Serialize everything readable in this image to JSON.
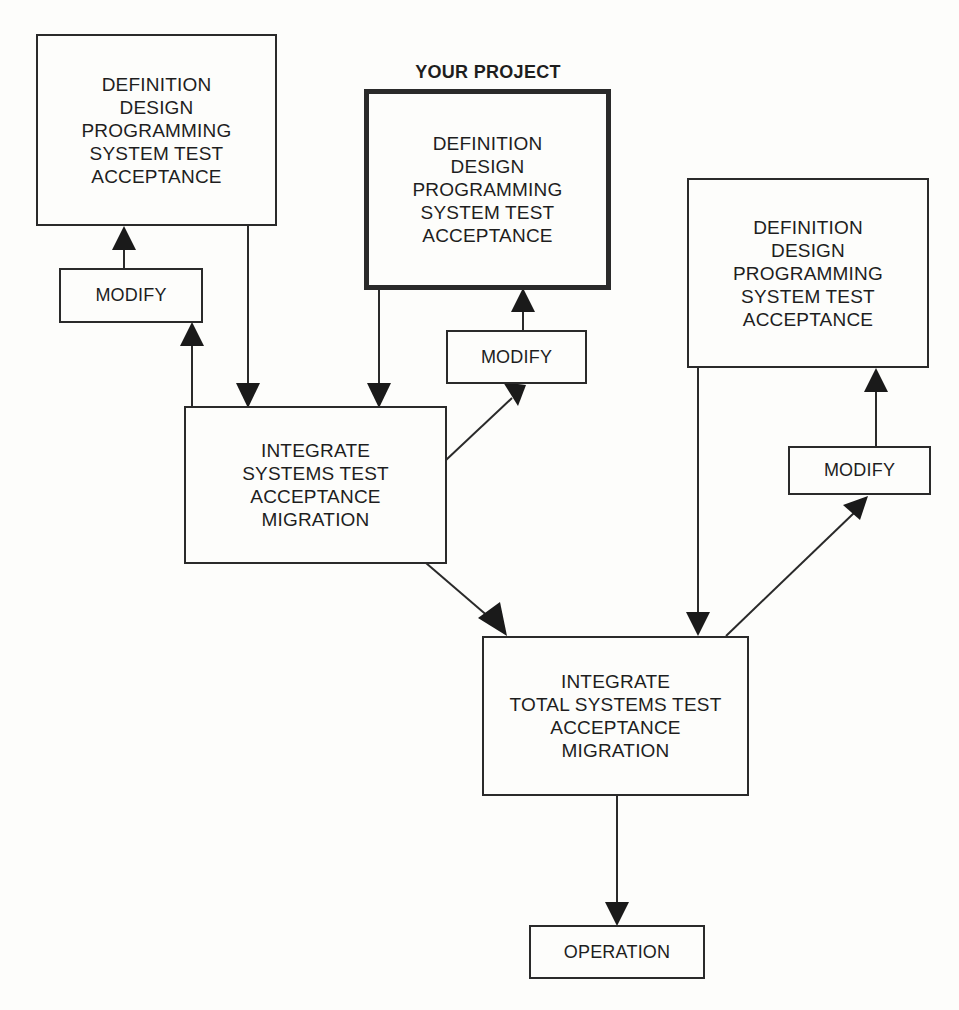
{
  "diagram": {
    "highlight_label": "YOUR PROJECT",
    "project_boxes": [
      {
        "id": "project-left",
        "lines": [
          "DEFINITION",
          "DESIGN",
          "PROGRAMMING",
          "SYSTEM TEST",
          "ACCEPTANCE"
        ]
      },
      {
        "id": "project-center",
        "lines": [
          "DEFINITION",
          "DESIGN",
          "PROGRAMMING",
          "SYSTEM TEST",
          "ACCEPTANCE"
        ],
        "highlighted": true
      },
      {
        "id": "project-right",
        "lines": [
          "DEFINITION",
          "DESIGN",
          "PROGRAMMING",
          "SYSTEM TEST",
          "ACCEPTANCE"
        ]
      }
    ],
    "modify_boxes": [
      {
        "id": "modify-left",
        "label": "MODIFY"
      },
      {
        "id": "modify-center",
        "label": "MODIFY"
      },
      {
        "id": "modify-right",
        "label": "MODIFY"
      }
    ],
    "integrate_box": {
      "lines": [
        "INTEGRATE",
        "SYSTEMS TEST",
        "ACCEPTANCE",
        "MIGRATION"
      ]
    },
    "total_box": {
      "lines": [
        "INTEGRATE",
        "TOTAL SYSTEMS TEST",
        "ACCEPTANCE",
        "MIGRATION"
      ]
    },
    "operation_box": {
      "label": "OPERATION"
    },
    "connections": [
      {
        "from": "project-left",
        "to": "integrate"
      },
      {
        "from": "project-center",
        "to": "integrate"
      },
      {
        "from": "integrate",
        "to": "modify-left"
      },
      {
        "from": "modify-left",
        "to": "project-left"
      },
      {
        "from": "integrate",
        "to": "modify-center"
      },
      {
        "from": "modify-center",
        "to": "project-center"
      },
      {
        "from": "integrate",
        "to": "total"
      },
      {
        "from": "project-right",
        "to": "total"
      },
      {
        "from": "total",
        "to": "modify-right"
      },
      {
        "from": "modify-right",
        "to": "project-right"
      },
      {
        "from": "total",
        "to": "operation"
      }
    ],
    "colors": {
      "stroke": "#2a2a2a",
      "background": "#fdfdfb",
      "text": "#1e1e1e"
    }
  }
}
